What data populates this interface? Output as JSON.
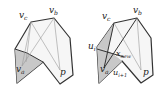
{
  "diagram": {
    "left_figure": {
      "labels": {
        "vc": "v",
        "vc_sub": "c",
        "vb": "v",
        "vb_sub": "b",
        "va": "v",
        "va_sub": "a",
        "p": "p"
      }
    },
    "right_figure": {
      "labels": {
        "vc": "v",
        "vc_sub": "c",
        "vb": "v",
        "vb_sub": "b",
        "va": "v",
        "va_sub": "a",
        "p": "p",
        "ui": "u",
        "ui_sub": "i",
        "ui1": "u",
        "ui1_sub": "i+1",
        "xnew": "x",
        "xnew_sub": "new"
      }
    },
    "colors": {
      "stroke": "#333333",
      "light_fill": "#f4f4f4",
      "shade_fill": "#c8c8c8",
      "thin_line": "#999999"
    }
  }
}
